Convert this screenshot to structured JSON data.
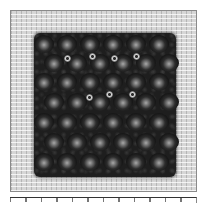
{
  "image": {
    "subject": "needlepoint stitch sample on canvas",
    "colors": {
      "background": "#ffffff",
      "canvas": "#d6d6d6",
      "stitching": "#1e1e1e",
      "frame_border": "#8a8a8a"
    },
    "stitch_grid": {
      "rows": [
        {
          "top": 0,
          "offset": 4,
          "count": 6
        },
        {
          "top": 19,
          "offset": 14,
          "count": 6
        },
        {
          "top": 38,
          "offset": 4,
          "count": 6
        },
        {
          "top": 58,
          "offset": 14,
          "count": 6
        },
        {
          "top": 78,
          "offset": 4,
          "count": 6
        },
        {
          "top": 98,
          "offset": 14,
          "count": 6
        },
        {
          "top": 118,
          "offset": 4,
          "count": 6
        }
      ],
      "spacing": 23
    },
    "eyelets": [
      {
        "x": 30,
        "y": 22
      },
      {
        "x": 55,
        "y": 20
      },
      {
        "x": 77,
        "y": 22
      },
      {
        "x": 99,
        "y": 20
      },
      {
        "x": 72,
        "y": 58
      },
      {
        "x": 95,
        "y": 58
      },
      {
        "x": 52,
        "y": 61
      }
    ]
  }
}
